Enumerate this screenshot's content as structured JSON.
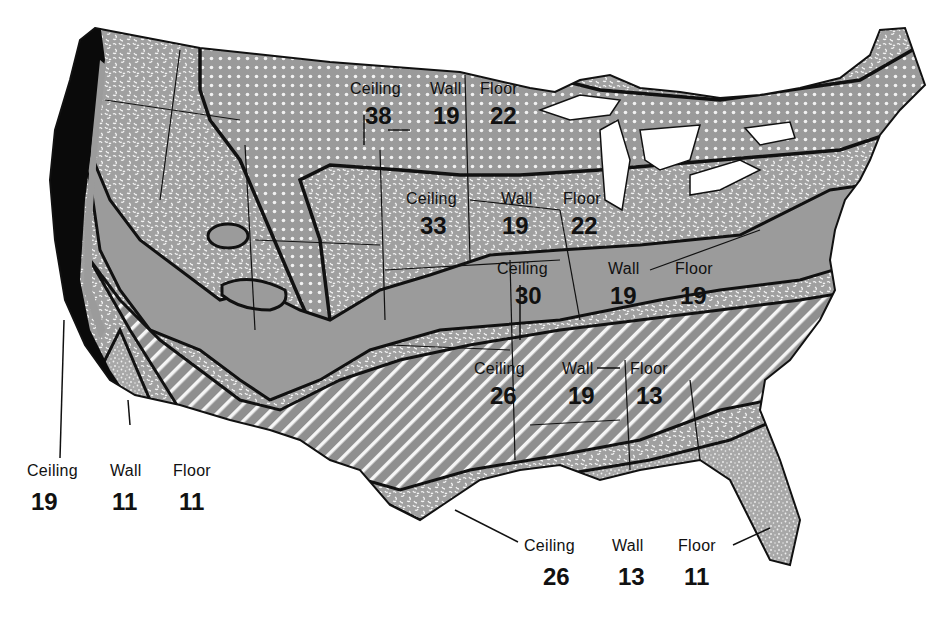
{
  "map": {
    "subject": "Recommended insulation R-values by climate zone, contiguous United States",
    "column_headers": [
      "Ceiling",
      "Wall",
      "Floor"
    ],
    "zones": [
      {
        "id": "zone-1",
        "ceiling": "38",
        "wall": "19",
        "floor": "22",
        "pattern": "dot-grid",
        "region": "northern tier"
      },
      {
        "id": "zone-2",
        "ceiling": "33",
        "wall": "19",
        "floor": "22",
        "pattern": "mottled",
        "region": "upper midwest / northeast"
      },
      {
        "id": "zone-3",
        "ceiling": "30",
        "wall": "19",
        "floor": "19",
        "pattern": "solid-gray",
        "region": "central band"
      },
      {
        "id": "zone-4",
        "ceiling": "26",
        "wall": "19",
        "floor": "13",
        "pattern": "diagonal-hatch",
        "region": "south-central band"
      },
      {
        "id": "zone-5",
        "ceiling": "26",
        "wall": "13",
        "floor": "11",
        "pattern": "fine-stipple",
        "region": "gulf coast / south"
      },
      {
        "id": "zone-6",
        "ceiling": "19",
        "wall": "11",
        "floor": "11",
        "pattern": "solid-black",
        "region": "pacific coast"
      }
    ]
  },
  "labels": {
    "z1": {
      "ceiling_h": "Ceiling",
      "wall_h": "Wall",
      "floor_h": "Floor",
      "ceiling": "38",
      "wall": "19",
      "floor": "22"
    },
    "z2": {
      "ceiling_h": "Ceiling",
      "wall_h": "Wall",
      "floor_h": "Floor",
      "ceiling": "33",
      "wall": "19",
      "floor": "22"
    },
    "z3": {
      "ceiling_h": "Ceiling",
      "wall_h": "Wall",
      "floor_h": "Floor",
      "ceiling": "30",
      "wall": "19",
      "floor": "19"
    },
    "z4": {
      "ceiling_h": "Ceiling",
      "wall_h": "Wall",
      "floor_h": "Floor",
      "ceiling": "26",
      "wall": "19",
      "floor": "13"
    },
    "z5": {
      "ceiling_h": "Ceiling",
      "wall_h": "Wall",
      "floor_h": "Floor",
      "ceiling": "26",
      "wall": "13",
      "floor": "11"
    },
    "z6": {
      "ceiling_h": "Ceiling",
      "wall_h": "Wall",
      "floor_h": "Floor",
      "ceiling": "19",
      "wall": "11",
      "floor": "11"
    }
  },
  "colors": {
    "background": "#ffffff",
    "land_gray": "#9a9a9a",
    "ink": "#111111",
    "coast_black": "#0a0a0a"
  }
}
